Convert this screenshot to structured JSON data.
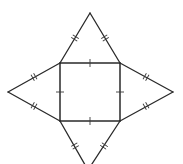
{
  "diagram": {
    "type": "pyramid-net",
    "stroke_color": "#2a2a2a",
    "background": "#ffffff",
    "square": {
      "x1": 60,
      "y1": 63,
      "x2": 120,
      "y2": 121,
      "side_marks": "single"
    },
    "apexes": {
      "top": [
        90,
        13
      ],
      "left": [
        8,
        92
      ],
      "right": [
        173,
        92
      ],
      "bottom": [
        88,
        170
      ]
    },
    "triangle_side_marks": "double"
  }
}
